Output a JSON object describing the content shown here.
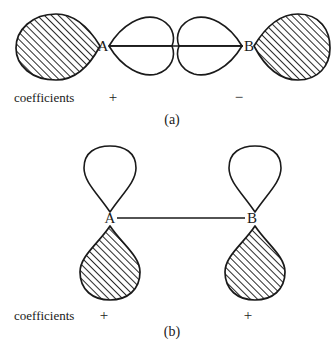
{
  "figure": {
    "title_text": "",
    "colors": {
      "ink": "#1a1a1a",
      "background": "#ffffff",
      "hatch": "#333333"
    },
    "panels": [
      {
        "id": "panel-a",
        "caption": "(a)",
        "coefficients_label": "coefficients",
        "atoms": [
          {
            "label": "A",
            "sign": "+"
          },
          {
            "label": "B",
            "sign": "−"
          }
        ],
        "orbital_type": "p-orbital-sideways-antibonding",
        "lobes": [
          {
            "position": "far-left",
            "fill": "hatched",
            "orientation": "horizontal-left",
            "sign": "+"
          },
          {
            "position": "inner-left",
            "fill": "white",
            "orientation": "horizontal-lens-upper",
            "sign": "+"
          },
          {
            "position": "inner-left-lower",
            "fill": "white",
            "orientation": "horizontal-lens-lower",
            "sign": "+"
          },
          {
            "position": "inner-right",
            "fill": "white",
            "orientation": "horizontal-lens-upper",
            "sign": "−"
          },
          {
            "position": "inner-right-lower",
            "fill": "white",
            "orientation": "horizontal-lens-lower",
            "sign": "−"
          },
          {
            "position": "far-right",
            "fill": "hatched",
            "orientation": "horizontal-right",
            "sign": "−"
          }
        ]
      },
      {
        "id": "panel-b",
        "caption": "(b)",
        "coefficients_label": "coefficients",
        "atoms": [
          {
            "label": "A",
            "sign": "+"
          },
          {
            "label": "B",
            "sign": "+"
          }
        ],
        "orbital_type": "p-orbital-perpendicular-bonding",
        "lobes": [
          {
            "position": "above-A",
            "fill": "white",
            "orientation": "vertical-up",
            "sign": "+"
          },
          {
            "position": "below-A",
            "fill": "hatched",
            "orientation": "vertical-down",
            "sign": "+"
          },
          {
            "position": "above-B",
            "fill": "white",
            "orientation": "vertical-up",
            "sign": "+"
          },
          {
            "position": "below-B",
            "fill": "hatched",
            "orientation": "vertical-down",
            "sign": "+"
          }
        ]
      }
    ]
  }
}
